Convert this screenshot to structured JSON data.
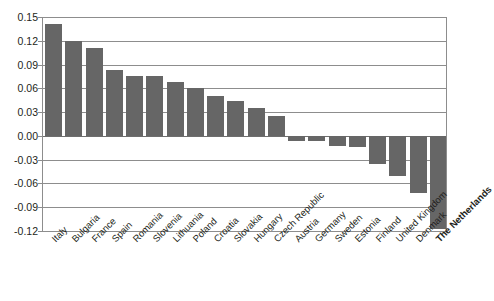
{
  "chart_data": {
    "type": "bar",
    "title": "",
    "subtitle": "",
    "xlabel": "",
    "ylabel": "",
    "ylim": [
      -0.12,
      0.15
    ],
    "grid": true,
    "legend": null,
    "bar_color": "#666666",
    "gridline_color": "#8d8d8d",
    "orientation": "vertical",
    "yticks": [
      "0.15",
      "0.12",
      "0.09",
      "0.06",
      "0.03",
      "0.00",
      "-0.03",
      "-0.06",
      "-0.09",
      "-0.12"
    ],
    "ytick_values": [
      0.15,
      0.12,
      0.09,
      0.06,
      0.03,
      0.0,
      -0.03,
      -0.06,
      -0.09,
      -0.12
    ],
    "categories": [
      "Italy",
      "Bulgaria",
      "France",
      "Spain",
      "Romania",
      "Slovenia",
      "Lithuania",
      "Poland",
      "Croatia",
      "Slovakia",
      "Hungary",
      "Czech Republic",
      "Austria",
      "Germany",
      "Sweden",
      "Estonia",
      "Finland",
      "United Kingdom",
      "Denmark",
      "The Netherlands"
    ],
    "values": [
      0.141,
      0.12,
      0.111,
      0.083,
      0.076,
      0.076,
      0.068,
      0.06,
      0.05,
      0.044,
      0.035,
      0.025,
      -0.006,
      -0.007,
      -0.013,
      -0.014,
      -0.035,
      -0.05,
      -0.072,
      -0.118
    ],
    "highlight_category": "The Netherlands"
  }
}
